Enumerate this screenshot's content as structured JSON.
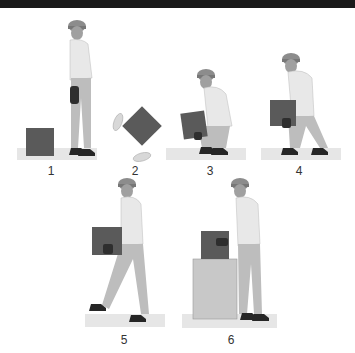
{
  "steps": [
    {
      "number": "1",
      "description": "Stand next to the box"
    },
    {
      "number": "2",
      "description": "Feet placement around box"
    },
    {
      "number": "3",
      "description": "Squat and grip the box"
    },
    {
      "number": "4",
      "description": "Lift with the legs"
    },
    {
      "number": "5",
      "description": "Carry box close to body"
    },
    {
      "number": "6",
      "description": "Set box down on surface"
    }
  ],
  "colors": {
    "box": "#5a5a5a",
    "platform": "#e6e6e6",
    "shirt": "#e8e8e8",
    "pants": "#bdbdbd",
    "helmet": "#8c8c8c",
    "glove": "#2e2e2e",
    "boot": "#262626",
    "skin": "#9a9a9a"
  }
}
